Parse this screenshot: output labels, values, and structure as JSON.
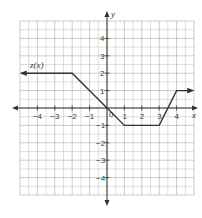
{
  "chart_data": {
    "type": "line",
    "title": "",
    "function_label": "z(x)",
    "xlabel": "x",
    "ylabel": "y",
    "xlim": [
      -5,
      5
    ],
    "ylim": [
      -5,
      5
    ],
    "grid": true,
    "grid_step": 0.5,
    "x_ticks": [
      -4,
      -3,
      -2,
      -1,
      1,
      2,
      3,
      4
    ],
    "y_ticks": [
      4,
      3,
      2,
      1,
      -1,
      -2,
      -3,
      -4
    ],
    "origin_label": "0",
    "series": [
      {
        "name": "z(x)",
        "points": [
          [
            -4.9,
            2
          ],
          [
            -2,
            2
          ],
          [
            0,
            0
          ],
          [
            1,
            -1
          ],
          [
            3,
            -1
          ],
          [
            4,
            1
          ],
          [
            4.9,
            1
          ]
        ],
        "arrow_left": true,
        "arrow_right": true
      }
    ],
    "colors": {
      "grid_minor": "#c8c8c8",
      "grid_major": "#a8a8a8",
      "axis": "#333333",
      "line": "#333333"
    }
  }
}
